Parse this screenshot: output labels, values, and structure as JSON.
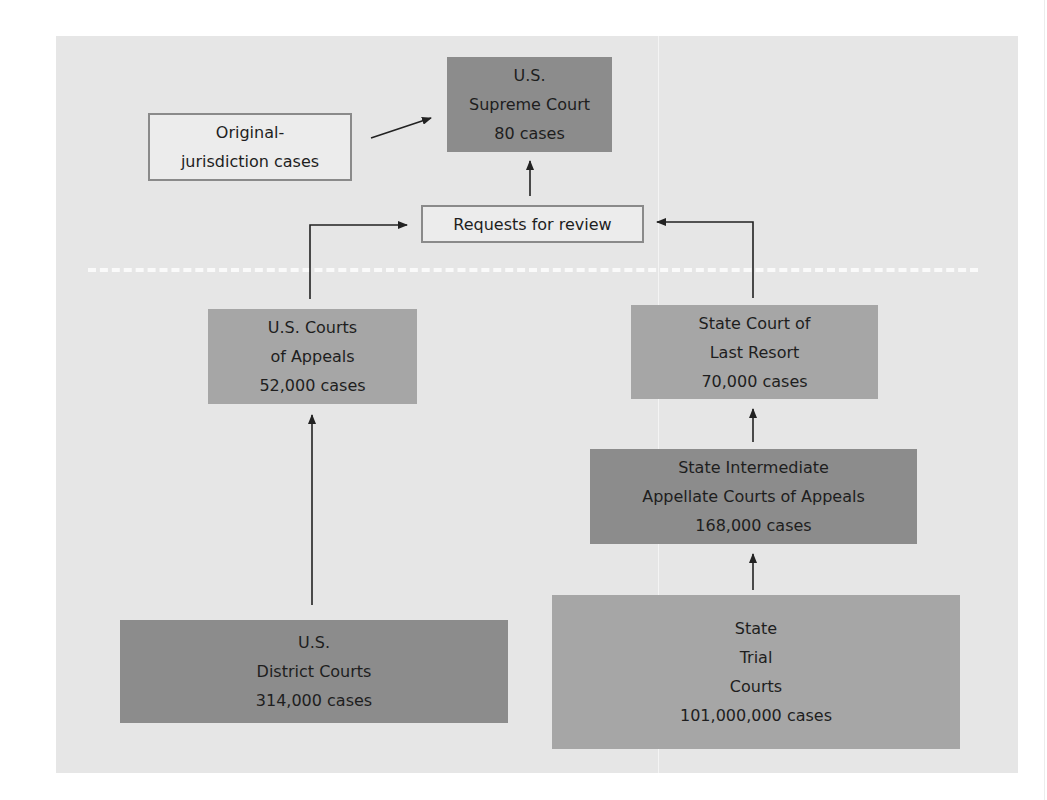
{
  "diagram": {
    "type": "flowchart",
    "nodes": {
      "supreme_court": {
        "lines": [
          "U.S.",
          "Supreme Court",
          "80 cases"
        ],
        "cases": 80
      },
      "original_jurisdiction": {
        "lines": [
          "Original-",
          "jurisdiction cases"
        ]
      },
      "requests_for_review": {
        "lines": [
          "Requests for review"
        ]
      },
      "us_courts_of_appeals": {
        "lines": [
          "U.S. Courts",
          "of Appeals",
          "52,000 cases"
        ],
        "cases": 52000
      },
      "state_court_last_resort": {
        "lines": [
          "State Court of",
          "Last Resort",
          "70,000 cases"
        ],
        "cases": 70000
      },
      "state_intermediate_appellate": {
        "lines": [
          "State Intermediate",
          "Appellate Courts of Appeals",
          "168,000 cases"
        ],
        "cases": 168000
      },
      "us_district_courts": {
        "lines": [
          "U.S.",
          "District Courts",
          "314,000 cases"
        ],
        "cases": 314000
      },
      "state_trial_courts": {
        "lines": [
          "State",
          "Trial",
          "Courts",
          "101,000,000 cases"
        ],
        "cases": 101000000
      }
    },
    "edges": [
      {
        "from": "original_jurisdiction",
        "to": "supreme_court"
      },
      {
        "from": "requests_for_review",
        "to": "supreme_court"
      },
      {
        "from": "us_courts_of_appeals",
        "to": "requests_for_review"
      },
      {
        "from": "state_court_last_resort",
        "to": "requests_for_review"
      },
      {
        "from": "state_intermediate_appellate",
        "to": "state_court_last_resort"
      },
      {
        "from": "state_trial_courts",
        "to": "state_intermediate_appellate"
      },
      {
        "from": "us_district_courts",
        "to": "us_courts_of_appeals"
      }
    ],
    "colors": {
      "panel": "#e6e6e6",
      "dark_box": "#8c8c8c",
      "mid_box": "#a6a6a6",
      "outline_border": "#8a8a8a",
      "divider": "#fafafa"
    }
  }
}
